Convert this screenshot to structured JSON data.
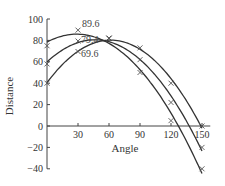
{
  "chart_data": {
    "type": "line",
    "title": "",
    "xlabel": "Angle",
    "ylabel": "Distance",
    "x": [
      0,
      30,
      60,
      90,
      120,
      150
    ],
    "xticks": [
      30,
      60,
      90,
      120,
      150
    ],
    "yticks": [
      -40,
      -20,
      0,
      20,
      40,
      60,
      80,
      100
    ],
    "xlim": [
      0,
      150
    ],
    "ylim": [
      -40,
      100
    ],
    "grid": false,
    "legend": null,
    "marker": "x",
    "series": [
      {
        "name": "curve-1",
        "values": [
          75,
          89.6,
          82,
          50,
          5,
          -40
        ]
      },
      {
        "name": "curve-2",
        "values": [
          58,
          79.4,
          82,
          62,
          22,
          -20
        ]
      },
      {
        "name": "curve-3",
        "values": [
          40,
          69.6,
          82,
          73,
          40,
          0
        ]
      }
    ],
    "annotations": [
      {
        "text": "89.6",
        "x": 30,
        "y": 89.6
      },
      {
        "text": "79.4",
        "x": 30,
        "y": 79.4
      },
      {
        "text": "69.6",
        "x": 30,
        "y": 69.6
      }
    ]
  }
}
